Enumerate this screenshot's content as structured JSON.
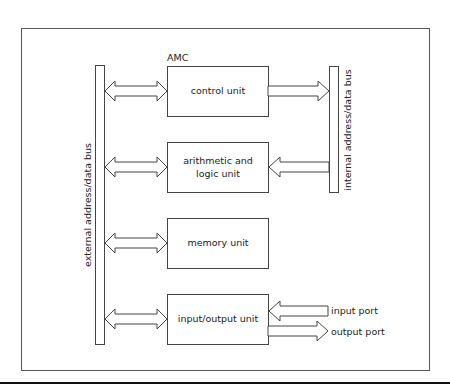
{
  "diagram": {
    "title": "AMC",
    "units": [
      {
        "id": "control",
        "label_lines": [
          "control unit"
        ]
      },
      {
        "id": "alu",
        "label_lines": [
          "arithmetic and",
          "logic unit"
        ]
      },
      {
        "id": "memory",
        "label_lines": [
          "memory unit"
        ]
      },
      {
        "id": "io",
        "label_lines": [
          "input/output unit"
        ]
      }
    ],
    "buses": {
      "external": "external address/data bus",
      "internal": "internal address/data bus"
    },
    "ports": {
      "input": "input port",
      "output": "output port"
    },
    "connections": [
      {
        "from": "external",
        "to": "control",
        "type": "bidirectional"
      },
      {
        "from": "external",
        "to": "alu",
        "type": "bidirectional"
      },
      {
        "from": "external",
        "to": "memory",
        "type": "bidirectional"
      },
      {
        "from": "external",
        "to": "io",
        "type": "bidirectional"
      },
      {
        "from": "control",
        "to": "internal",
        "type": "unidirectional"
      },
      {
        "from": "internal",
        "to": "alu",
        "type": "unidirectional"
      },
      {
        "from": "input",
        "to": "io",
        "type": "unidirectional"
      },
      {
        "from": "io",
        "to": "output",
        "type": "unidirectional"
      }
    ]
  }
}
